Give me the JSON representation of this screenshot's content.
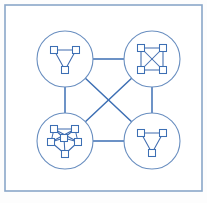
{
  "figure": {
    "width": 207,
    "height": 203,
    "background_color": "#fdfdfd"
  },
  "colors": {
    "frame_stroke": "#8aa7c9",
    "circle_stroke": "#6a8fc0",
    "link_stroke": "#3d6fb4",
    "node_stroke": "#3d6fb4",
    "node_fill": "#ffffff",
    "inner_edge_stroke": "#2f5fa8",
    "panel_fill": "#ffffff"
  },
  "frame": {
    "x": 5,
    "y": 5,
    "width": 197,
    "height": 186,
    "stroke_width": 1.6
  },
  "chart_data": {
    "type": "diagram",
    "clusters": [
      {
        "id": "cluster-top-left",
        "label": "top-left",
        "cx": 65,
        "cy": 59,
        "r": 28,
        "subgraph": {
          "kind": "triangle",
          "node_count": 3,
          "edge_count": 3,
          "nodes": [
            {
              "id": "tl-1",
              "x": -11,
              "y": -9
            },
            {
              "id": "tl-2",
              "x": 11,
              "y": -9
            },
            {
              "id": "tl-3",
              "x": 0,
              "y": 11
            }
          ],
          "edges": [
            [
              "tl-1",
              "tl-2"
            ],
            [
              "tl-2",
              "tl-3"
            ],
            [
              "tl-3",
              "tl-1"
            ]
          ]
        }
      },
      {
        "id": "cluster-top-right",
        "label": "top-right",
        "cx": 152,
        "cy": 59,
        "r": 28,
        "subgraph": {
          "kind": "complete-k4",
          "node_count": 4,
          "edge_count": 6,
          "nodes": [
            {
              "id": "tr-1",
              "x": -11,
              "y": -11
            },
            {
              "id": "tr-2",
              "x": 11,
              "y": -11
            },
            {
              "id": "tr-3",
              "x": 11,
              "y": 11
            },
            {
              "id": "tr-4",
              "x": -11,
              "y": 11
            }
          ],
          "edges": [
            [
              "tr-1",
              "tr-2"
            ],
            [
              "tr-2",
              "tr-3"
            ],
            [
              "tr-3",
              "tr-4"
            ],
            [
              "tr-4",
              "tr-1"
            ],
            [
              "tr-1",
              "tr-3"
            ],
            [
              "tr-2",
              "tr-4"
            ]
          ]
        }
      },
      {
        "id": "cluster-bottom-left",
        "label": "bottom-left",
        "cx": 65,
        "cy": 141,
        "r": 28,
        "subgraph": {
          "kind": "dense-cluster",
          "node_count": 6,
          "edge_count": 12,
          "nodes": [
            {
              "id": "bl-1",
              "x": -11,
              "y": -12
            },
            {
              "id": "bl-2",
              "x": 10,
              "y": -12
            },
            {
              "id": "bl-3",
              "x": -14,
              "y": 1
            },
            {
              "id": "bl-4",
              "x": 13,
              "y": 1
            },
            {
              "id": "bl-5",
              "x": -1,
              "y": -3
            },
            {
              "id": "bl-6",
              "x": 0,
              "y": 13
            }
          ],
          "edges": [
            [
              "bl-1",
              "bl-2"
            ],
            [
              "bl-1",
              "bl-3"
            ],
            [
              "bl-1",
              "bl-4"
            ],
            [
              "bl-1",
              "bl-5"
            ],
            [
              "bl-2",
              "bl-3"
            ],
            [
              "bl-2",
              "bl-4"
            ],
            [
              "bl-2",
              "bl-5"
            ],
            [
              "bl-3",
              "bl-5"
            ],
            [
              "bl-3",
              "bl-6"
            ],
            [
              "bl-4",
              "bl-5"
            ],
            [
              "bl-4",
              "bl-6"
            ],
            [
              "bl-5",
              "bl-6"
            ]
          ]
        }
      },
      {
        "id": "cluster-bottom-right",
        "label": "bottom-right",
        "cx": 152,
        "cy": 141,
        "r": 28,
        "subgraph": {
          "kind": "triangle",
          "node_count": 3,
          "edge_count": 3,
          "nodes": [
            {
              "id": "br-1",
              "x": -11,
              "y": -8
            },
            {
              "id": "br-2",
              "x": 11,
              "y": -8
            },
            {
              "id": "br-3",
              "x": 0,
              "y": 12
            }
          ],
          "edges": [
            [
              "br-1",
              "br-2"
            ],
            [
              "br-2",
              "br-3"
            ],
            [
              "br-3",
              "br-1"
            ]
          ]
        }
      }
    ],
    "cluster_links": [
      {
        "from": "cluster-top-left",
        "to": "cluster-top-right",
        "kind": "horizontal-top"
      },
      {
        "from": "cluster-bottom-left",
        "to": "cluster-bottom-right",
        "kind": "horizontal-bottom"
      },
      {
        "from": "cluster-top-left",
        "to": "cluster-bottom-left",
        "kind": "vertical-left"
      },
      {
        "from": "cluster-top-right",
        "to": "cluster-bottom-right",
        "kind": "vertical-right"
      },
      {
        "from": "cluster-top-left",
        "to": "cluster-bottom-right",
        "kind": "diagonal"
      },
      {
        "from": "cluster-top-right",
        "to": "cluster-bottom-left",
        "kind": "diagonal"
      }
    ],
    "node_shape": "square",
    "node_size": 7,
    "legend": null,
    "axis": null,
    "grid": false
  }
}
